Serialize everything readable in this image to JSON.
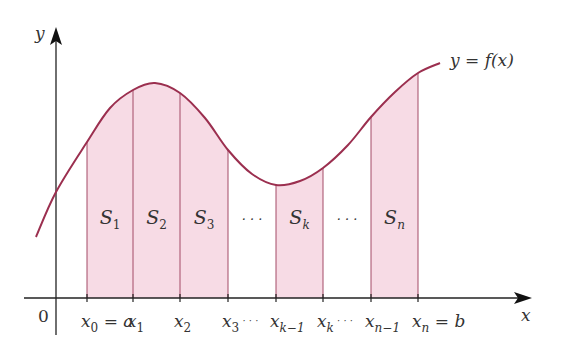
{
  "colors": {
    "curve": "#9b2f4f",
    "fill": "#f7dbe5",
    "strip_line": "#a34a66",
    "axis": "#222222"
  },
  "axes": {
    "x_label": "x",
    "y_label": "y",
    "origin_label": "0"
  },
  "curve_label": "y = f(x)",
  "ticks": [
    {
      "id": "x0",
      "base": "x",
      "sub": "0",
      "suffix": " = a"
    },
    {
      "id": "x1",
      "base": "x",
      "sub": "1",
      "suffix": ""
    },
    {
      "id": "x2",
      "base": "x",
      "sub": "2",
      "suffix": ""
    },
    {
      "id": "x3",
      "base": "x",
      "sub": "3",
      "suffix": " · · ·"
    },
    {
      "id": "xkm1",
      "base": "x",
      "sub": "k−1",
      "suffix": ""
    },
    {
      "id": "xk",
      "base": "x",
      "sub": "k",
      "suffix": " · · ·"
    },
    {
      "id": "xnm1",
      "base": "x",
      "sub": "n−1",
      "suffix": ""
    },
    {
      "id": "xn",
      "base": "x",
      "sub": "n",
      "suffix": " = b"
    }
  ],
  "strips": [
    {
      "label_base": "S",
      "label_sub": "1",
      "shaded": true
    },
    {
      "label_base": "S",
      "label_sub": "2",
      "shaded": true
    },
    {
      "label_base": "S",
      "label_sub": "3",
      "shaded": true
    },
    {
      "label_base": "· · ·",
      "label_sub": "",
      "shaded": false
    },
    {
      "label_base": "S",
      "label_sub": "k",
      "shaded": true
    },
    {
      "label_base": "· · ·",
      "label_sub": "",
      "shaded": false
    },
    {
      "label_base": "S",
      "label_sub": "n",
      "shaded": true
    }
  ]
}
